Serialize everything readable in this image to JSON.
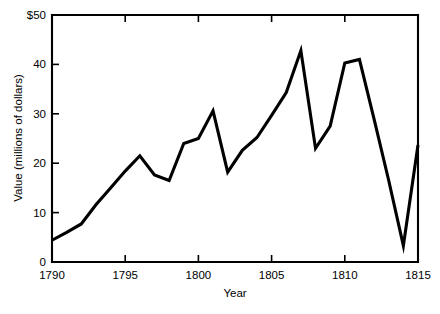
{
  "chart_data": {
    "type": "line",
    "title": "",
    "subtitle": "",
    "xlabel": "Year",
    "ylabel": "Value (millions of dollars)",
    "xlim": [
      1790,
      1815
    ],
    "ylim": [
      0,
      50
    ],
    "grid": false,
    "legend": null,
    "legend_position": "none",
    "xticks": [
      1790,
      1795,
      1800,
      1805,
      1810,
      1815
    ],
    "xticklabels": [
      "1790",
      "1795",
      "1800",
      "1805",
      "1810",
      "1815"
    ],
    "yticks": [
      0,
      10,
      20,
      30,
      40,
      50
    ],
    "yticklabels": [
      "0",
      "10",
      "20",
      "30",
      "40",
      "$50"
    ],
    "line_color": "#000000",
    "x": [
      1790,
      1791,
      1792,
      1793,
      1794,
      1795,
      1796,
      1797,
      1798,
      1799,
      1800,
      1801,
      1802,
      1803,
      1804,
      1805,
      1806,
      1807,
      1808,
      1809,
      1810,
      1811,
      1812,
      1813,
      1814,
      1815
    ],
    "values": [
      4.4,
      6.0,
      7.7,
      11.6,
      15.0,
      18.4,
      21.5,
      17.6,
      16.5,
      24.0,
      25.0,
      30.6,
      18.2,
      22.6,
      25.2,
      29.7,
      34.3,
      42.8,
      23.0,
      27.5,
      40.3,
      41.0,
      28.9,
      16.5,
      3.3,
      23.7
    ]
  },
  "axes": {
    "x_title": "Year",
    "y_title": "Value (millions of dollars)"
  }
}
